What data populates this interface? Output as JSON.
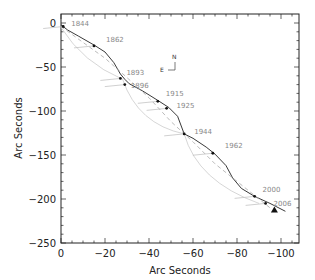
{
  "chart_data": {
    "type": "line",
    "title": "",
    "xlabel": "Arc Seconds",
    "ylabel": "Arc Seconds",
    "xlim": [
      0,
      -108
    ],
    "ylim": [
      -250,
      10
    ],
    "xticks": [
      0,
      -20,
      -40,
      -60,
      -80,
      -100
    ],
    "yticks": [
      0,
      -50,
      -100,
      -150,
      -200,
      -250
    ],
    "grid": false,
    "compass": {
      "north": "N",
      "east": "E"
    },
    "series": [
      {
        "name": "orbit-track",
        "style": "solid-black",
        "points": [
          [
            0,
            -2
          ],
          [
            -3,
            -8
          ],
          [
            -8,
            -15
          ],
          [
            -15,
            -25
          ],
          [
            -20,
            -33
          ],
          [
            -24,
            -45
          ],
          [
            -27,
            -58
          ],
          [
            -29,
            -64
          ],
          [
            -31,
            -69
          ],
          [
            -37,
            -77
          ],
          [
            -44,
            -88
          ],
          [
            -49,
            -96
          ],
          [
            -53,
            -106
          ],
          [
            -56,
            -126
          ],
          [
            -60,
            -131
          ],
          [
            -66,
            -141
          ],
          [
            -70,
            -149
          ],
          [
            -75,
            -162
          ],
          [
            -78,
            -176
          ],
          [
            -82,
            -188
          ],
          [
            -88,
            -197
          ],
          [
            -95,
            -205
          ],
          [
            -102,
            -214
          ]
        ]
      },
      {
        "name": "secondary-track",
        "style": "dashed-gray",
        "points": [
          [
            0,
            -4
          ],
          [
            -10,
            -22
          ],
          [
            -20,
            -40
          ],
          [
            -30,
            -62
          ],
          [
            -40,
            -85
          ],
          [
            -50,
            -112
          ],
          [
            -60,
            -135
          ],
          [
            -70,
            -160
          ],
          [
            -80,
            -180
          ],
          [
            -95,
            -210
          ]
        ]
      }
    ],
    "epochs": [
      {
        "label": "1844",
        "x": -1,
        "y": -4
      },
      {
        "label": "1862",
        "x": -15,
        "y": -26
      },
      {
        "label": "1893",
        "x": -27,
        "y": -63
      },
      {
        "label": "1896",
        "x": -29,
        "y": -70
      },
      {
        "label": "1915",
        "x": -44,
        "y": -89
      },
      {
        "label": "1925",
        "x": -48,
        "y": -97
      },
      {
        "label": "1944",
        "x": -56,
        "y": -126
      },
      {
        "label": "1962",
        "x": -69,
        "y": -148
      },
      {
        "label": "2000",
        "x": -88,
        "y": -197
      },
      {
        "label": "2006",
        "x": -93,
        "y": -205
      }
    ],
    "marker": {
      "type": "triangle",
      "x": -97,
      "y": -213
    }
  }
}
